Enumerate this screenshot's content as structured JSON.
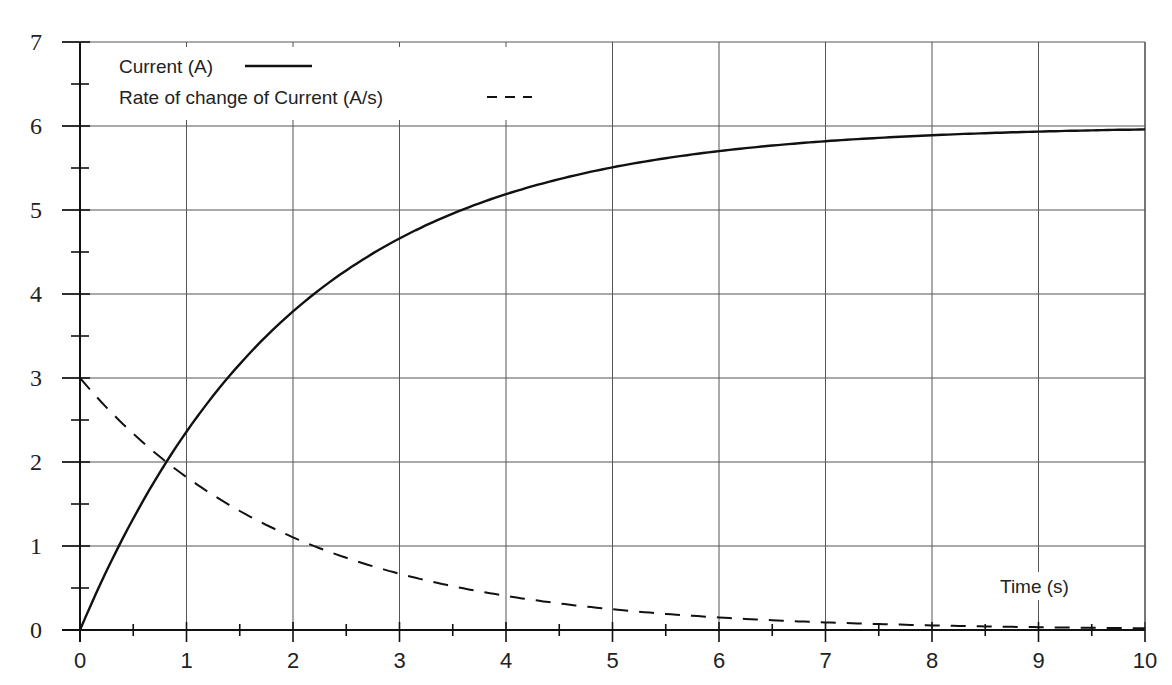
{
  "chart_data": {
    "type": "line",
    "title": "",
    "xlabel": "Time (s)",
    "ylabel": "",
    "xlim": [
      0,
      10
    ],
    "ylim": [
      0,
      7
    ],
    "grid": true,
    "legend_position": "top-left",
    "x_ticks": [
      "0",
      "1",
      "2",
      "3",
      "4",
      "5",
      "6",
      "7",
      "8",
      "9",
      "10"
    ],
    "y_ticks": [
      "0",
      "1",
      "2",
      "3",
      "4",
      "5",
      "6",
      "7"
    ],
    "x": [
      0,
      0.5,
      1,
      1.5,
      2,
      2.5,
      3,
      3.5,
      4,
      4.5,
      5,
      5.5,
      6,
      6.5,
      7,
      7.5,
      8,
      8.5,
      9,
      9.5,
      10
    ],
    "series": [
      {
        "name": "Current (A)",
        "style": "solid",
        "color": "#111111",
        "values": [
          0,
          1.33,
          2.36,
          3.16,
          3.79,
          4.28,
          4.66,
          4.96,
          5.19,
          5.37,
          5.51,
          5.62,
          5.7,
          5.77,
          5.82,
          5.86,
          5.89,
          5.91,
          5.93,
          5.95,
          5.96
        ]
      },
      {
        "name": "Rate of change of Current (A/s)",
        "style": "dashed",
        "color": "#111111",
        "values": [
          3.0,
          2.34,
          1.82,
          1.42,
          1.1,
          0.86,
          0.67,
          0.52,
          0.41,
          0.32,
          0.25,
          0.19,
          0.15,
          0.12,
          0.09,
          0.07,
          0.05,
          0.04,
          0.03,
          0.03,
          0.02
        ]
      }
    ],
    "annotations": [
      {
        "text": "Time (s)",
        "x": 9,
        "y": 0.45
      }
    ]
  },
  "legend": {
    "items": [
      {
        "label": "Current (A)",
        "style": "solid"
      },
      {
        "label": "Rate of change of Current (A/s)",
        "style": "dashed"
      }
    ]
  },
  "axis": {
    "x_label": "Time (s)"
  }
}
